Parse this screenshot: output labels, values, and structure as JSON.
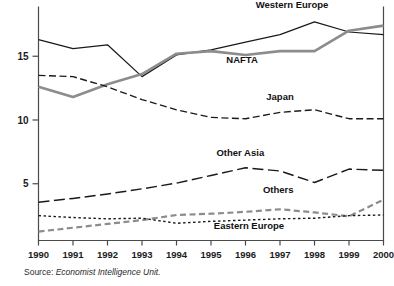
{
  "source": {
    "prefix": "Source: ",
    "body": "Economist Intelligence Unit."
  },
  "chart_data": {
    "type": "line",
    "title": "",
    "xlabel": "",
    "ylabel": "",
    "x": [
      1990,
      1991,
      1992,
      1993,
      1994,
      1995,
      1996,
      1997,
      1998,
      1999,
      2000
    ],
    "xtick_labels": [
      "1990",
      "1991",
      "1992",
      "1993",
      "1994",
      "1995",
      "1996",
      "1997",
      "1998",
      "1999",
      "2000"
    ],
    "ytick_values": [
      5,
      10,
      15
    ],
    "ytick_labels": [
      "5",
      "10",
      "15"
    ],
    "xlim": [
      1990,
      2000
    ],
    "ylim": [
      0.55,
      18.9
    ],
    "grid": false,
    "legend_position": "inline-annotations",
    "series": [
      {
        "name": "Western Europe",
        "values": [
          16.3,
          15.6,
          15.9,
          13.4,
          15.1,
          15.5,
          16.1,
          16.7,
          17.7,
          16.9,
          16.7
        ],
        "color": "#1a1a1a",
        "style": "solid",
        "width": 1.25,
        "dasharray": "",
        "label": "Western Europe",
        "label_x": 1997.35,
        "label_y": 18.75
      },
      {
        "name": "NAFTA",
        "values": [
          12.6,
          11.8,
          12.8,
          13.6,
          15.2,
          15.4,
          15.1,
          15.4,
          15.4,
          17.0,
          17.4
        ],
        "color": "#8c8c8c",
        "style": "solid",
        "width": 2.6,
        "dasharray": "",
        "label": "NAFTA",
        "label_x": 1995.9,
        "label_y": 14.5
      },
      {
        "name": "Japan",
        "values": [
          13.5,
          13.4,
          12.6,
          11.6,
          10.8,
          10.2,
          10.1,
          10.6,
          10.8,
          10.1,
          10.1
        ],
        "color": "#1a1a1a",
        "style": "dashed",
        "width": 1.35,
        "dasharray": "7,3.5",
        "label": "Japan",
        "label_x": 1997.0,
        "label_y": 11.55
      },
      {
        "name": "Other Asia",
        "values": [
          3.55,
          3.85,
          4.2,
          4.6,
          5.05,
          5.65,
          6.25,
          6.0,
          5.1,
          6.15,
          6.05
        ],
        "color": "#1a1a1a",
        "style": "long-dashed",
        "width": 1.45,
        "dasharray": "11,4.5",
        "label": "Other Asia",
        "label_x": 1995.85,
        "label_y": 7.15
      },
      {
        "name": "Others",
        "values": [
          1.25,
          1.55,
          1.85,
          2.15,
          2.55,
          2.65,
          2.8,
          3.0,
          2.75,
          2.45,
          3.75
        ],
        "color": "#8c8c8c",
        "style": "dashed",
        "width": 2.2,
        "dasharray": "6,3.5",
        "label": "Others",
        "label_x": 1996.95,
        "label_y": 4.25
      },
      {
        "name": "Eastern Europe",
        "values": [
          2.5,
          2.35,
          2.25,
          2.3,
          1.9,
          2.05,
          2.15,
          2.25,
          2.3,
          2.5,
          2.55
        ],
        "color": "#1a1a1a",
        "style": "dotted",
        "width": 1.4,
        "dasharray": "2.5,2.5",
        "label": "Eastern Europe",
        "label_x": 1996.1,
        "label_y": 1.45
      }
    ]
  }
}
